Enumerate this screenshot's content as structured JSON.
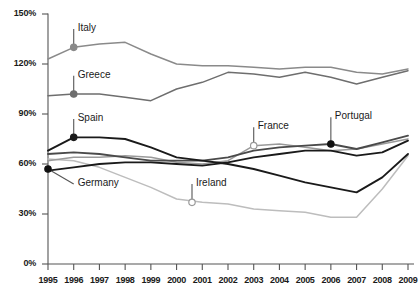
{
  "chart_data": {
    "type": "line",
    "title": "",
    "subtitle": "",
    "xlabel": "",
    "ylabel": "",
    "grid": false,
    "legend_position": "inline-callout-labels",
    "x": [
      1995,
      1996,
      1997,
      1998,
      1999,
      2000,
      2001,
      2002,
      2003,
      2004,
      2005,
      2006,
      2007,
      2008,
      2009
    ],
    "xtick_labels": [
      "1995",
      "1996",
      "1997",
      "1998",
      "1999",
      "2000",
      "2001",
      "2002",
      "2003",
      "2004",
      "2005",
      "2006",
      "2007",
      "2008",
      "2009"
    ],
    "ytick_labels": [
      "0%",
      "30%",
      "60%",
      "90%",
      "120%",
      "150%"
    ],
    "ytick_values": [
      0,
      30,
      60,
      90,
      120,
      150
    ],
    "ylim": [
      0,
      150
    ],
    "xlim": [
      1995,
      2009
    ],
    "series": [
      {
        "name": "Italy",
        "color": "#8a8a8a",
        "marker_color": "#8a8a8a",
        "marker_x": 1996,
        "marker_y": 130,
        "label_x": 1996,
        "label_y": 141,
        "values": [
          123,
          130,
          132,
          133,
          126,
          120,
          119,
          119,
          118,
          117,
          118,
          118,
          115,
          114,
          117
        ]
      },
      {
        "name": "Greece",
        "color": "#6e6e6e",
        "marker_color": "#6e6e6e",
        "marker_x": 1996,
        "marker_y": 102,
        "label_x": 1996,
        "label_y": 113,
        "values": [
          101,
          102,
          102,
          100,
          98,
          105,
          109,
          115,
          114,
          112,
          115,
          112,
          108,
          112,
          116
        ]
      },
      {
        "name": "Spain",
        "color": "#1a1a1a",
        "marker_color": "#1a1a1a",
        "marker_x": 1996,
        "marker_y": 76,
        "label_x": 1996,
        "label_y": 87,
        "values": [
          68,
          76,
          76,
          75,
          70,
          64,
          62,
          60,
          57,
          53,
          49,
          46,
          43,
          52,
          66
        ]
      },
      {
        "name": "France",
        "color": "#9a9a9a",
        "marker_color": "#aaaaaa",
        "marker_x": 2003,
        "marker_y": 71,
        "label_x": 2003,
        "label_y": 82,
        "values": [
          62,
          64,
          64,
          65,
          64,
          61,
          60,
          62,
          71,
          72,
          70,
          68,
          69,
          72,
          75
        ]
      },
      {
        "name": "Portugal",
        "color": "#4a4a4a",
        "marker_color": "#111111",
        "marker_x": 2006,
        "marker_y": 72,
        "label_x": 2006,
        "label_y": 88,
        "values": [
          66,
          67,
          66,
          64,
          62,
          62,
          62,
          64,
          68,
          70,
          71,
          72,
          69,
          73,
          77
        ]
      },
      {
        "name": "Germany",
        "color": "#1a1a1a",
        "marker_color": "#111111",
        "marker_x": 1995,
        "marker_y": 57,
        "label_x": 1996,
        "label_y": 48,
        "values": [
          56,
          58,
          60,
          61,
          61,
          60,
          59,
          61,
          64,
          66,
          68,
          68,
          65,
          67,
          74
        ]
      },
      {
        "name": "Ireland",
        "color": "#bdbdbd",
        "marker_color": "#c4c4c4",
        "marker_x": 2000.6,
        "marker_y": 37,
        "label_x": 2000.6,
        "label_y": 48,
        "values": [
          63,
          62,
          58,
          52,
          46,
          39,
          37,
          36,
          33,
          32,
          31,
          28,
          28,
          45,
          65
        ]
      }
    ]
  },
  "axis": {
    "y_axis_name": "percent-of-gdp",
    "x_axis_name": "year"
  }
}
